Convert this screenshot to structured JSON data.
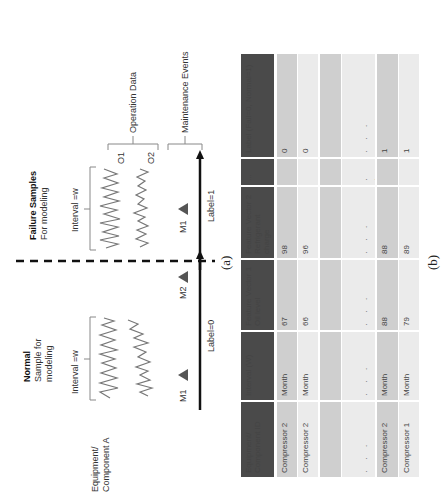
{
  "figure": {
    "caption_a": "(a)",
    "caption_b": "(b)",
    "orientation": "rotated 90 degrees (text reads bottom-to-top)"
  },
  "diagram": {
    "equipment_label_line1": "Equipment/",
    "equipment_label_line2": "Component A",
    "normal": {
      "title": "Normal",
      "subtitle_line1": "Sample for",
      "subtitle_line2": "modeling",
      "interval_label": "Interval =w",
      "events": [
        "M1",
        "M2"
      ],
      "label": "Label=0"
    },
    "failure": {
      "title": "Failure Samples",
      "subtitle": "For modeling",
      "interval_label": "Interval =w",
      "events": [
        "M1"
      ],
      "label": "Label=1"
    },
    "operation_series": [
      "O1",
      "O2"
    ],
    "operation_data_label": "Operation Data",
    "maintenance_events_label": "Maintenance Events"
  },
  "table": {
    "headers": [
      "Equipment/ Component ID",
      "Interval (W)",
      "Feature Vector 1 Oil level",
      "Feature Vector 2 Refrigerant charge",
      "...",
      "Label (Fail=0, Normal=1)"
    ],
    "rows": [
      [
        "Compressor 2",
        "Month",
        "67",
        "98",
        "",
        "0"
      ],
      [
        "Compressor 2",
        "Month",
        "66",
        "96",
        "",
        "0"
      ],
      [
        "",
        "",
        "",
        "",
        "",
        ""
      ],
      [
        "· · ·",
        "· · ·",
        "· · ·",
        "· · ·",
        "· · ·",
        "· · ·"
      ],
      [
        "Compressor 2",
        "Month",
        "88",
        "88",
        "",
        "1"
      ],
      [
        "Compressor 1",
        "Month",
        "79",
        "89",
        "",
        "1"
      ]
    ]
  },
  "colors": {
    "header_bg": "#4a4a4a",
    "band_mid": "#cfcfcf",
    "band_light": "#ebebeb",
    "marker": "#555555"
  }
}
